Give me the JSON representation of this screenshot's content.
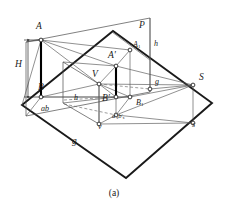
{
  "figure": {
    "caption": "(a)",
    "labels": [
      {
        "id": "A",
        "text": "A",
        "x": 36,
        "y": 27,
        "size": "cap"
      },
      {
        "id": "H",
        "text": "H",
        "x": 17,
        "y": 58,
        "size": "cap"
      },
      {
        "id": "B",
        "text": "B",
        "x": 39,
        "y": 85,
        "size": "cap"
      },
      {
        "id": "ab",
        "text": "ab",
        "x": 42,
        "y": 108,
        "size": "small"
      },
      {
        "id": "P",
        "text": "P",
        "x": 140,
        "y": 26,
        "size": "cap"
      },
      {
        "id": "A1",
        "text": "A1",
        "x": 134,
        "y": 42,
        "size": "small"
      },
      {
        "id": "h-right",
        "text": "h",
        "x": 154,
        "y": 44,
        "size": "small"
      },
      {
        "id": "Aprime",
        "text": "A'",
        "x": 110,
        "y": 56,
        "size": "cap"
      },
      {
        "id": "V",
        "text": "V",
        "x": 94,
        "y": 75,
        "size": "cap"
      },
      {
        "id": "g-mid",
        "text": "g",
        "x": 155,
        "y": 83,
        "size": "small"
      },
      {
        "id": "S",
        "text": "S",
        "x": 200,
        "y": 79,
        "size": "cap"
      },
      {
        "id": "h-left",
        "text": "h",
        "x": 75,
        "y": 98,
        "size": "small"
      },
      {
        "id": "Bprime",
        "text": "B'",
        "x": 104,
        "y": 98,
        "size": "cap"
      },
      {
        "id": "B1",
        "text": "B1",
        "x": 137,
        "y": 103,
        "size": "small"
      },
      {
        "id": "axbx",
        "text": "axbx",
        "x": 114,
        "y": 118,
        "size": "tiny"
      },
      {
        "id": "v",
        "text": "v",
        "x": 99,
        "y": 127,
        "size": "small"
      },
      {
        "id": "s",
        "text": "s",
        "x": 193,
        "y": 125,
        "size": "small"
      },
      {
        "id": "g-bot",
        "text": "g",
        "x": 73,
        "y": 140,
        "size": "cap"
      }
    ],
    "colors": {
      "ink": "#2b2b2b",
      "thin": "#555555",
      "bold": "#000000",
      "background": "#ffffff"
    },
    "points": {
      "A": [
        41,
        40
      ],
      "B": [
        41,
        97
      ],
      "Aprime": [
        116,
        66
      ],
      "Bprime": [
        116,
        97
      ],
      "A1": [
        130,
        50
      ],
      "B1": [
        130,
        97
      ],
      "V": [
        99,
        84
      ],
      "v": [
        99,
        124
      ],
      "S": [
        193,
        85
      ],
      "s": [
        193,
        123
      ],
      "ax": [
        116,
        115
      ],
      "g_mid": [
        150,
        89
      ]
    },
    "geometry_note": "descriptive-geometry projection diagram: ground plane parallelogram, vertical projection plane P, height H, points A,B with projections"
  }
}
